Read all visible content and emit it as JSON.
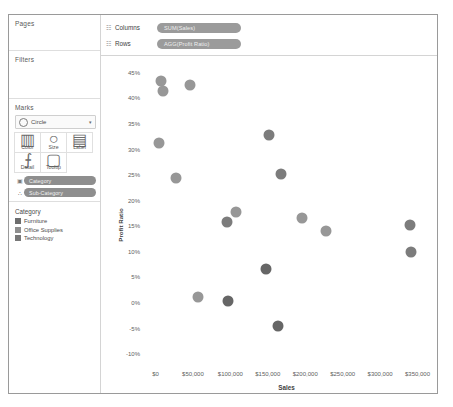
{
  "sidebar": {
    "pages": {
      "label": "Pages"
    },
    "filters": {
      "label": "Filters"
    },
    "marks": {
      "label": "Marks",
      "mark_type": "Circle",
      "caret": "▾",
      "buttons": [
        {
          "name": "color",
          "label": "Color",
          "icon": "▥"
        },
        {
          "name": "size",
          "label": "Size",
          "icon": "○"
        },
        {
          "name": "label",
          "label": "Label",
          "icon": "▤"
        },
        {
          "name": "detail",
          "label": "Detail",
          "icon": "⨍"
        },
        {
          "name": "tooltip",
          "label": "Tooltip",
          "icon": "▢"
        }
      ],
      "pills": [
        {
          "icon": "▣",
          "label": "Category"
        },
        {
          "icon": "∴",
          "label": "Sub-Category"
        }
      ]
    },
    "legend": {
      "title": "Category",
      "items": [
        {
          "label": "Furniture",
          "color": "#6d6d6d"
        },
        {
          "label": "Office Supplies",
          "color": "#8f8f8f"
        },
        {
          "label": "Technology",
          "color": "#787878"
        }
      ]
    }
  },
  "shelves": [
    {
      "icon": "☷",
      "label": "Columns",
      "pill": "SUM(Sales)"
    },
    {
      "icon": "☷",
      "label": "Rows",
      "pill": "AGG(Profit Ratio)"
    }
  ],
  "chart_data": {
    "type": "scatter",
    "title": "",
    "xlabel": "Sales",
    "ylabel": "Profit Ratio",
    "xlim": [
      -18000,
      368000
    ],
    "ylim": [
      -0.125,
      0.475
    ],
    "grid": false,
    "legend_position": "left-sidebar",
    "xticks": [
      {
        "value": 0,
        "label": "$0"
      },
      {
        "value": 50000,
        "label": "$50,000"
      },
      {
        "value": 100000,
        "label": "$100,000"
      },
      {
        "value": 150000,
        "label": "$150,000"
      },
      {
        "value": 200000,
        "label": "$200,000"
      },
      {
        "value": 250000,
        "label": "$250,000"
      },
      {
        "value": 300000,
        "label": "$300,000"
      },
      {
        "value": 350000,
        "label": "$350,000"
      }
    ],
    "yticks": [
      {
        "value": 0.45,
        "label": "45%"
      },
      {
        "value": 0.4,
        "label": "40%"
      },
      {
        "value": 0.35,
        "label": "35%"
      },
      {
        "value": 0.3,
        "label": "30%"
      },
      {
        "value": 0.25,
        "label": "25%"
      },
      {
        "value": 0.2,
        "label": "20%"
      },
      {
        "value": 0.15,
        "label": "15%"
      },
      {
        "value": 0.1,
        "label": "10%"
      },
      {
        "value": 0.05,
        "label": "5%"
      },
      {
        "value": 0.0,
        "label": "0%"
      },
      {
        "value": -0.05,
        "label": "-5%"
      },
      {
        "value": -0.1,
        "label": "-10%"
      }
    ],
    "series": [
      {
        "name": "Office Supplies",
        "color": "#979797",
        "points": [
          {
            "x": 7500,
            "y": 0.433
          },
          {
            "x": 9500,
            "y": 0.415
          },
          {
            "x": 46000,
            "y": 0.427
          },
          {
            "x": 4500,
            "y": 0.313
          },
          {
            "x": 27000,
            "y": 0.245
          },
          {
            "x": 108000,
            "y": 0.178
          },
          {
            "x": 196000,
            "y": 0.166
          },
          {
            "x": 228000,
            "y": 0.14
          },
          {
            "x": 57000,
            "y": 0.012
          }
        ]
      },
      {
        "name": "Technology",
        "color": "#7c7c7c",
        "points": [
          {
            "x": 151000,
            "y": 0.328
          },
          {
            "x": 168000,
            "y": 0.253
          },
          {
            "x": 95000,
            "y": 0.158
          },
          {
            "x": 340000,
            "y": 0.152
          },
          {
            "x": 341000,
            "y": 0.1
          }
        ]
      },
      {
        "name": "Furniture",
        "color": "#666666",
        "points": [
          {
            "x": 148000,
            "y": 0.066
          },
          {
            "x": 97000,
            "y": 0.004
          },
          {
            "x": 163000,
            "y": -0.044
          }
        ]
      }
    ]
  }
}
